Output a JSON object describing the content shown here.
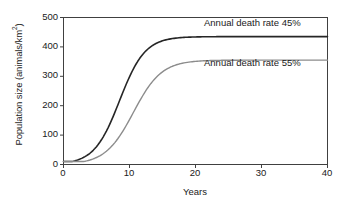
{
  "chart_data": {
    "type": "line",
    "title": "",
    "xlabel": "Years",
    "ylabel": "Population size (animals/km²)",
    "ylabel_text": "Population size (animals/km",
    "ylabel_sup": "2",
    "ylabel_tail": ")",
    "xlim": [
      0,
      40
    ],
    "ylim": [
      0,
      500
    ],
    "xticks": [
      0,
      10,
      20,
      30,
      40
    ],
    "xtick_labels": [
      "0",
      "10",
      "20",
      "30",
      "40"
    ],
    "yticks": [
      0,
      100,
      200,
      300,
      400,
      500
    ],
    "ytick_labels": [
      "0",
      "100",
      "200",
      "300",
      "400",
      "500"
    ],
    "grid": false,
    "legend_position": "inline-annotations",
    "series": [
      {
        "name": "Annual death rate 45%",
        "color": "#262626",
        "linewidth": 1.6,
        "plateau": 435,
        "initial": 10,
        "inflection_year": 8.5,
        "growth_rate": 0.52,
        "x": [
          0,
          1,
          2,
          3,
          4,
          5,
          6,
          7,
          8,
          9,
          10,
          11,
          12,
          13,
          14,
          15,
          16,
          17,
          18,
          20,
          25,
          30,
          35,
          40
        ],
        "y": [
          10,
          16,
          26,
          42,
          66,
          103,
          155,
          222,
          298,
          344,
          382,
          406,
          420,
          428,
          432,
          434,
          435,
          435,
          435,
          435,
          435,
          435,
          435,
          435
        ]
      },
      {
        "name": "Annual death rate 55%",
        "color": "#8c8c8c",
        "linewidth": 1.4,
        "plateau": 355,
        "initial": 10,
        "inflection_year": 10.6,
        "growth_rate": 0.47,
        "x": [
          0,
          1,
          2,
          3,
          4,
          5,
          6,
          7,
          8,
          9,
          10,
          11,
          12,
          13,
          14,
          15,
          16,
          17,
          18,
          20,
          25,
          30,
          35,
          40
        ],
        "y": [
          10,
          15,
          23,
          35,
          53,
          79,
          114,
          158,
          208,
          248,
          282,
          310,
          328,
          340,
          347,
          351,
          353,
          354,
          355,
          355,
          355,
          355,
          355,
          355
        ]
      }
    ],
    "annotations": [
      {
        "text": "Annual death rate 45%",
        "series": "Annual death rate 45%"
      },
      {
        "text": "Annual death rate 55%",
        "series": "Annual death rate 55%"
      }
    ],
    "axes": {
      "line_color": "#404040",
      "background": "#ffffff",
      "top_spine": true,
      "right_spine": true,
      "bottom_spine": true,
      "left_spine": true
    }
  }
}
